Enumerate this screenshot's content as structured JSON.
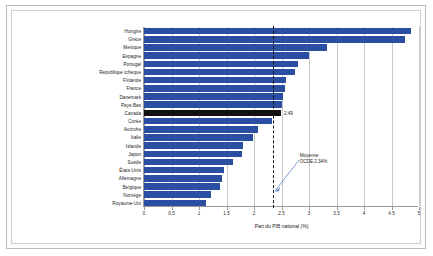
{
  "chart_data": {
    "type": "bar",
    "orientation": "horizontal",
    "title": "",
    "xlabel": "Part du PIB national (%)",
    "ylabel": "",
    "xlim": [
      0,
      5
    ],
    "xticks": [
      "0",
      "0.5",
      "1",
      "1.5",
      "2",
      "2.5",
      "3",
      "3.5",
      "4",
      "4.5",
      "5"
    ],
    "grid": true,
    "legend": "none",
    "categories": [
      "Hongrie",
      "Grèce",
      "Mexique",
      "Espagne",
      "Portugal",
      "République tchèque",
      "Finlande",
      "France",
      "Danemark",
      "Pays-Bas",
      "Canada",
      "Corée",
      "Autriche",
      "Italie",
      "Islande",
      "Japon",
      "Suède",
      "États-Unis",
      "Allemagne",
      "Belgique",
      "Norvège",
      "Royaume-Uni"
    ],
    "values": [
      4.85,
      4.75,
      3.32,
      3.0,
      2.8,
      2.75,
      2.58,
      2.56,
      2.52,
      2.5,
      2.49,
      2.32,
      2.08,
      1.98,
      1.8,
      1.78,
      1.62,
      1.45,
      1.42,
      1.38,
      1.22,
      1.12
    ],
    "highlight_category": "Canada",
    "data_labels": {
      "Canada": "2.49"
    },
    "reference_line": {
      "value": 2.34,
      "label_line1": "Moyenne",
      "label_line2": "OCDE 2.34%",
      "style": "dashed"
    },
    "colors": {
      "bar": "#2a4fa2",
      "highlight_bar": "#111111",
      "grid": "#c8c8c8",
      "axis": "#9a9a9a",
      "reference_line": "#111111",
      "background": "#ffffff"
    }
  }
}
